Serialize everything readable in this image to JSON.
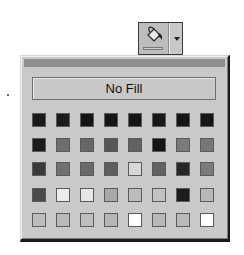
{
  "toolbar": {
    "fill_color_button": {
      "icon": "paint-bucket-icon",
      "dropdown_icon": "chevron-down-icon"
    }
  },
  "popup": {
    "no_fill_label": "No Fill",
    "palette": {
      "columns": 8,
      "rows": [
        [
          "#1a1a1a",
          "#1c1c1c",
          "#141414",
          "#151515",
          "#161616",
          "#181818",
          "#151515",
          "#171717"
        ],
        [
          "#1a1a1a",
          "#6e6e6e",
          "#666666",
          "#565656",
          "#626262",
          "#141414",
          "#7a7a7a",
          "#777777"
        ],
        [
          "#3a3a3a",
          "#707070",
          "#6a6a6a",
          "#5e5e5e",
          "#d8d8d8",
          "#626262",
          "#262626",
          "#7a7a7a"
        ],
        [
          "#4a4a4a",
          "#ececec",
          "#e6e6e6",
          "#a8a8a8",
          "#bcbcbc",
          "#c2c2c2",
          "#1c1c1c",
          "#b8b8b8"
        ],
        [
          "#bdbdbd",
          "#b9b9b9",
          "#bebebe",
          "#b6b6b6",
          "#ffffff",
          "#b8b8b8",
          "#b9b9b9",
          "#ffffff"
        ]
      ]
    }
  }
}
